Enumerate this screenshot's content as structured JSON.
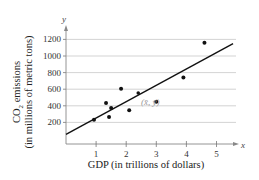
{
  "chart_data": {
    "type": "scatter",
    "title": "",
    "xlabel": "GDP (in trillions of dollars)",
    "ylabel_line1": "CO2 emissions",
    "ylabel_line2": "(in millions of metric tons)",
    "x_axis_var": "x",
    "y_axis_var": "y",
    "xlim": [
      0,
      5.6
    ],
    "ylim": [
      0,
      1300
    ],
    "x_ticks": [
      1,
      2,
      3,
      4,
      5
    ],
    "y_ticks": [
      200,
      400,
      600,
      800,
      1000,
      1200
    ],
    "grid": "horizontal",
    "legend": "none",
    "series": [
      {
        "name": "data points",
        "points": [
          {
            "x": 0.93,
            "y": 232
          },
          {
            "x": 1.33,
            "y": 435
          },
          {
            "x": 1.43,
            "y": 265
          },
          {
            "x": 1.5,
            "y": 375
          },
          {
            "x": 1.83,
            "y": 605
          },
          {
            "x": 2.1,
            "y": 345
          },
          {
            "x": 3.0,
            "y": 450
          },
          {
            "x": 3.9,
            "y": 740
          },
          {
            "x": 4.6,
            "y": 1160
          }
        ]
      }
    ],
    "regression_line": {
      "x0": 0,
      "y0": 55,
      "x1": 5.55,
      "y1": 1150
    },
    "mean_point": {
      "x": 2.4,
      "y": 555,
      "label": "(x̄, ȳ)"
    }
  }
}
